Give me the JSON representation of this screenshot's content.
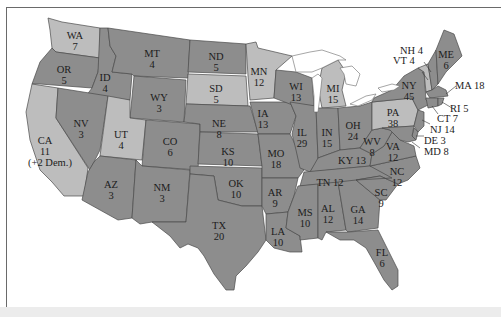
{
  "map": {
    "title": "Electoral votes by state",
    "colors": {
      "dark": "#8d8d8d",
      "light": "#bdbdbd",
      "background": "#ffffff",
      "border": "#4a4a4a",
      "text": "#1c1c1c"
    },
    "states": [
      {
        "abbr": "WA",
        "votes": "7",
        "shade": "light"
      },
      {
        "abbr": "OR",
        "votes": "5",
        "shade": "dark"
      },
      {
        "abbr": "CA",
        "votes": "11",
        "note": "(+2 Dem.)",
        "shade": "light"
      },
      {
        "abbr": "ID",
        "votes": "4",
        "shade": "dark"
      },
      {
        "abbr": "NV",
        "votes": "3",
        "shade": "dark"
      },
      {
        "abbr": "MT",
        "votes": "4",
        "shade": "dark"
      },
      {
        "abbr": "WY",
        "votes": "3",
        "shade": "dark"
      },
      {
        "abbr": "UT",
        "votes": "4",
        "shade": "light"
      },
      {
        "abbr": "AZ",
        "votes": "3",
        "shade": "dark"
      },
      {
        "abbr": "CO",
        "votes": "6",
        "shade": "dark"
      },
      {
        "abbr": "NM",
        "votes": "3",
        "shade": "dark"
      },
      {
        "abbr": "ND",
        "votes": "5",
        "shade": "dark"
      },
      {
        "abbr": "SD",
        "votes": "5",
        "shade": "light"
      },
      {
        "abbr": "NE",
        "votes": "8",
        "shade": "dark"
      },
      {
        "abbr": "KS",
        "votes": "10",
        "shade": "dark"
      },
      {
        "abbr": "OK",
        "votes": "10",
        "shade": "dark"
      },
      {
        "abbr": "TX",
        "votes": "20",
        "shade": "dark"
      },
      {
        "abbr": "MN",
        "votes": "12",
        "shade": "light"
      },
      {
        "abbr": "IA",
        "votes": "13",
        "shade": "dark"
      },
      {
        "abbr": "MO",
        "votes": "18",
        "shade": "dark"
      },
      {
        "abbr": "AR",
        "votes": "9",
        "shade": "dark"
      },
      {
        "abbr": "LA",
        "votes": "10",
        "shade": "dark"
      },
      {
        "abbr": "WI",
        "votes": "13",
        "shade": "dark"
      },
      {
        "abbr": "IL",
        "votes": "29",
        "shade": "dark"
      },
      {
        "abbr": "MI",
        "votes": "15",
        "shade": "light"
      },
      {
        "abbr": "IN",
        "votes": "15",
        "shade": "dark"
      },
      {
        "abbr": "OH",
        "votes": "24",
        "shade": "dark"
      },
      {
        "abbr": "KY",
        "votes": "13",
        "shade": "dark"
      },
      {
        "abbr": "TN",
        "votes": "12",
        "shade": "dark"
      },
      {
        "abbr": "MS",
        "votes": "10",
        "shade": "dark"
      },
      {
        "abbr": "AL",
        "votes": "12",
        "shade": "dark"
      },
      {
        "abbr": "GA",
        "votes": "14",
        "shade": "dark"
      },
      {
        "abbr": "FL",
        "votes": "6",
        "shade": "dark"
      },
      {
        "abbr": "SC",
        "votes": "9",
        "shade": "dark"
      },
      {
        "abbr": "NC",
        "votes": "12",
        "shade": "dark"
      },
      {
        "abbr": "VA",
        "votes": "12",
        "shade": "dark"
      },
      {
        "abbr": "WV",
        "votes": "8",
        "shade": "dark"
      },
      {
        "abbr": "PA",
        "votes": "38",
        "shade": "light"
      },
      {
        "abbr": "NY",
        "votes": "45",
        "shade": "dark"
      },
      {
        "abbr": "VT",
        "votes": "4",
        "shade": "light"
      },
      {
        "abbr": "NH",
        "votes": "4",
        "shade": "dark"
      },
      {
        "abbr": "ME",
        "votes": "6",
        "shade": "dark"
      },
      {
        "abbr": "MA",
        "votes": "18",
        "shade": "dark"
      },
      {
        "abbr": "RI",
        "votes": "5",
        "shade": "dark"
      },
      {
        "abbr": "CT",
        "votes": "7",
        "shade": "dark"
      },
      {
        "abbr": "NJ",
        "votes": "14",
        "shade": "dark"
      },
      {
        "abbr": "DE",
        "votes": "3",
        "shade": "dark"
      },
      {
        "abbr": "MD",
        "votes": "8",
        "shade": "dark"
      }
    ],
    "labels": {
      "WA": "WA",
      "WA_v": "7",
      "OR": "OR",
      "OR_v": "5",
      "CA": "CA",
      "CA_v": "11",
      "CA_note": "(+2 Dem.)",
      "ID": "ID",
      "ID_v": "4",
      "NV": "NV",
      "NV_v": "3",
      "MT": "MT",
      "MT_v": "4",
      "WY": "WY",
      "WY_v": "3",
      "UT": "UT",
      "UT_v": "4",
      "AZ": "AZ",
      "AZ_v": "3",
      "CO": "CO",
      "CO_v": "6",
      "NM": "NM",
      "NM_v": "3",
      "ND": "ND",
      "ND_v": "5",
      "SD": "SD",
      "SD_v": "5",
      "NE": "NE",
      "NE_v": "8",
      "KS": "KS",
      "KS_v": "10",
      "OK": "OK",
      "OK_v": "10",
      "TX": "TX",
      "TX_v": "20",
      "MN": "MN",
      "MN_v": "12",
      "IA": "IA",
      "IA_v": "13",
      "MO": "MO",
      "MO_v": "18",
      "AR": "AR",
      "AR_v": "9",
      "LA": "LA",
      "LA_v": "10",
      "WI": "WI",
      "WI_v": "13",
      "IL": "IL",
      "IL_v": "29",
      "MI": "MI",
      "MI_v": "15",
      "IN": "IN",
      "IN_v": "15",
      "OH": "OH",
      "OH_v": "24",
      "KY": "KY 13",
      "TN": "TN 12",
      "MS": "MS",
      "MS_v": "10",
      "AL": "AL",
      "AL_v": "12",
      "GA": "GA",
      "GA_v": "14",
      "FL": "FL",
      "FL_v": "6",
      "SC": "SC",
      "SC_v": "9",
      "NC": "NC",
      "NC_v": "12",
      "VA": "VA",
      "VA_v": "12",
      "WV": "WV",
      "WV_v": "8",
      "PA": "PA",
      "PA_v": "38",
      "NY": "NY",
      "NY_v": "45",
      "ME": "ME",
      "ME_v": "6",
      "NH": "NH 4",
      "VT": "VT 4",
      "MA": "MA 18",
      "RI": "RI 5",
      "CT": "CT 7",
      "NJ": "NJ 14",
      "DE": "DE 3",
      "MD": "MD 8"
    }
  }
}
